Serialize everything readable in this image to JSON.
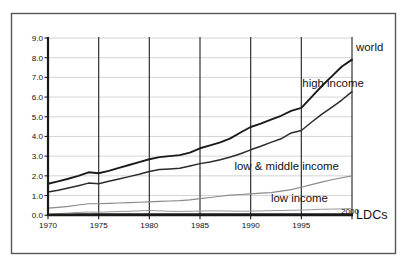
{
  "chart_data": {
    "type": "line",
    "title": "",
    "xlabel": "",
    "ylabel": "",
    "xlim": [
      1970,
      2000
    ],
    "ylim": [
      0.0,
      9.0
    ],
    "grid": true,
    "legend_position": "inline-right",
    "x_ticks": [
      "1970",
      "1975",
      "1980",
      "1985",
      "1990",
      "1995",
      "2000"
    ],
    "y_ticks": [
      "0.0",
      "1.0",
      "2.0",
      "3.0",
      "4.0",
      "5.0",
      "6.0",
      "7.0",
      "8.0",
      "9.0"
    ],
    "x": [
      1970,
      1971,
      1972,
      1973,
      1974,
      1975,
      1976,
      1977,
      1978,
      1979,
      1980,
      1981,
      1982,
      1983,
      1984,
      1985,
      1986,
      1987,
      1988,
      1989,
      1990,
      1991,
      1992,
      1993,
      1994,
      1995,
      1996,
      1997,
      1998,
      1999,
      2000
    ],
    "series": [
      {
        "name": "world",
        "label": "world",
        "color": "#1b1b1b",
        "values": [
          1.6,
          1.72,
          1.85,
          2.0,
          2.18,
          2.13,
          2.25,
          2.4,
          2.55,
          2.7,
          2.84,
          2.95,
          3.0,
          3.05,
          3.18,
          3.4,
          3.55,
          3.7,
          3.9,
          4.2,
          4.48,
          4.65,
          4.85,
          5.05,
          5.3,
          5.45,
          6.0,
          6.55,
          7.05,
          7.55,
          7.9
        ]
      },
      {
        "name": "high income",
        "label": "high income",
        "color": "#2b2b2b",
        "values": [
          1.18,
          1.27,
          1.38,
          1.5,
          1.63,
          1.6,
          1.72,
          1.84,
          1.96,
          2.08,
          2.22,
          2.32,
          2.35,
          2.38,
          2.5,
          2.62,
          2.7,
          2.82,
          2.96,
          3.12,
          3.32,
          3.5,
          3.7,
          3.88,
          4.18,
          4.3,
          4.72,
          5.12,
          5.48,
          5.85,
          6.28
        ]
      },
      {
        "name": "low & middle income",
        "label": "low & middle income",
        "color": "#8a8a8a",
        "values": [
          0.36,
          0.4,
          0.45,
          0.52,
          0.58,
          0.58,
          0.6,
          0.62,
          0.64,
          0.66,
          0.68,
          0.7,
          0.72,
          0.74,
          0.78,
          0.84,
          0.9,
          0.96,
          1.02,
          1.05,
          1.08,
          1.12,
          1.15,
          1.22,
          1.3,
          1.42,
          1.55,
          1.68,
          1.8,
          1.9,
          2.0
        ]
      },
      {
        "name": "low income",
        "label": "low income",
        "color": "#9a9a9a",
        "values": [
          0.06,
          0.08,
          0.11,
          0.14,
          0.16,
          0.15,
          0.17,
          0.19,
          0.2,
          0.22,
          0.24,
          0.22,
          0.2,
          0.19,
          0.2,
          0.21,
          0.22,
          0.22,
          0.21,
          0.2,
          0.21,
          0.22,
          0.23,
          0.24,
          0.25,
          0.26,
          0.28,
          0.3,
          0.31,
          0.32,
          0.34
        ]
      },
      {
        "name": "LDCs",
        "label": "LDCs",
        "color": "#1b1b1b",
        "values": [
          0.04,
          0.05,
          0.05,
          0.06,
          0.07,
          0.06,
          0.06,
          0.06,
          0.06,
          0.06,
          0.07,
          0.07,
          0.07,
          0.06,
          0.06,
          0.06,
          0.06,
          0.06,
          0.06,
          0.06,
          0.06,
          0.06,
          0.06,
          0.06,
          0.06,
          0.06,
          0.06,
          0.06,
          0.06,
          0.06,
          0.06
        ]
      }
    ],
    "annotations": [
      {
        "text": "world",
        "x": 2000.4,
        "y": 8.55
      },
      {
        "text": "high income",
        "x": 1995.1,
        "y": 6.72
      },
      {
        "text": "low & middle income",
        "x": 1988.4,
        "y": 2.52
      },
      {
        "text": "low income",
        "x": 1992.0,
        "y": 0.88
      },
      {
        "text": "LDCs",
        "x": 2000.4,
        "y": 0.02
      }
    ]
  }
}
